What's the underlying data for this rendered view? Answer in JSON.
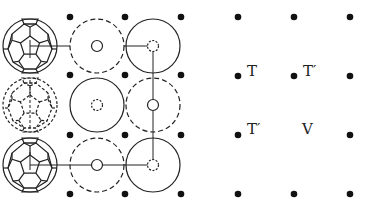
{
  "diagram": {
    "left_panel": {
      "dot_columns_x": [
        70,
        125,
        181
      ],
      "dot_rows_y": [
        17,
        75,
        135,
        194
      ],
      "cell_columns_x": [
        30,
        97,
        153
      ],
      "cell_rows_y": [
        46,
        105,
        165
      ],
      "big_radius": 27,
      "small_radius": 5.5,
      "rows": [
        {
          "molecule": "c60-solid",
          "cells": [
            {
              "outer": "dashed",
              "inner": "solid"
            },
            {
              "outer": "solid",
              "inner": "dashed"
            }
          ]
        },
        {
          "molecule": "c60-dashed",
          "cells": [
            {
              "outer": "solid",
              "inner": "dashed"
            },
            {
              "outer": "dashed",
              "inner": "solid"
            }
          ]
        },
        {
          "molecule": "c60-solid",
          "cells": [
            {
              "outer": "dashed",
              "inner": "solid"
            },
            {
              "outer": "solid",
              "inner": "dashed"
            }
          ]
        }
      ]
    },
    "right_panel": {
      "dot_columns_x": [
        238,
        294,
        350
      ],
      "dot_rows_y": [
        17,
        76,
        135,
        194
      ],
      "missing_dots": [
        [
          294,
          135
        ]
      ],
      "labels": [
        {
          "text": "T",
          "x": 247,
          "y": 76
        },
        {
          "text": "T′",
          "x": 303,
          "y": 76
        },
        {
          "text": "T′",
          "x": 247,
          "y": 134
        },
        {
          "text": "V",
          "x": 302,
          "y": 134
        }
      ]
    },
    "colors": {
      "stroke": "#222222",
      "dot": "#111111",
      "background": "#ffffff"
    }
  }
}
